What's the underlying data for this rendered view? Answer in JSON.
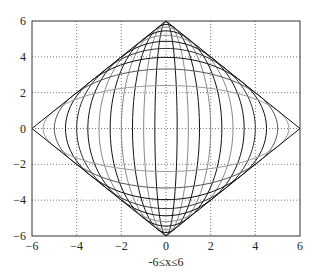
{
  "chart_data": {
    "type": "line",
    "title": "",
    "xlabel": "-6≤x≤6",
    "ylabel": "",
    "xlim": [
      -6,
      6
    ],
    "ylim": [
      -6,
      6
    ],
    "xticks": [
      -6,
      -4,
      -2,
      0,
      2,
      4,
      6
    ],
    "yticks": [
      -6,
      -4,
      -2,
      0,
      2,
      4,
      6
    ],
    "xtick_labels": [
      "-6",
      "-4",
      "-2",
      "0",
      "2",
      "4",
      "6"
    ],
    "ytick_labels": [
      "-6",
      "-4",
      "-2",
      "0",
      "2",
      "4",
      "6"
    ],
    "grid": true,
    "grid_style": "dotted",
    "legend": null,
    "series": [
      {
        "name": "ellipse a=0.5",
        "a": 0.5,
        "b": 5.98,
        "color": "#111111"
      },
      {
        "name": "ellipse a=1.0",
        "a": 1.0,
        "b": 5.92,
        "color": "#888888"
      },
      {
        "name": "ellipse a=1.5",
        "a": 1.5,
        "b": 5.81,
        "color": "#111111"
      },
      {
        "name": "ellipse a=2.0",
        "a": 2.0,
        "b": 5.66,
        "color": "#888888"
      },
      {
        "name": "ellipse a=2.5",
        "a": 2.5,
        "b": 5.45,
        "color": "#111111"
      },
      {
        "name": "ellipse a=3.0",
        "a": 3.0,
        "b": 5.2,
        "color": "#888888"
      },
      {
        "name": "ellipse a=3.5",
        "a": 3.5,
        "b": 4.87,
        "color": "#111111"
      },
      {
        "name": "ellipse a=4.0",
        "a": 4.0,
        "b": 4.47,
        "color": "#333333"
      },
      {
        "name": "ellipse a=4.5",
        "a": 4.5,
        "b": 3.97,
        "color": "#111111"
      },
      {
        "name": "ellipse a=5.0",
        "a": 5.0,
        "b": 3.32,
        "color": "#555555"
      },
      {
        "name": "ellipse a=5.5",
        "a": 5.5,
        "b": 2.4,
        "color": "#999999"
      },
      {
        "name": "diamond envelope",
        "points": [
          [
            6,
            0
          ],
          [
            0,
            6
          ],
          [
            -6,
            0
          ],
          [
            0,
            -6
          ],
          [
            6,
            0
          ]
        ],
        "color": "#111111"
      }
    ]
  }
}
